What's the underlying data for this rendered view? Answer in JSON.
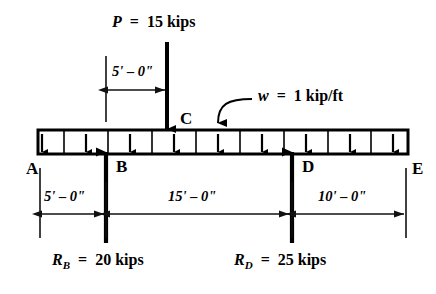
{
  "diagram": {
    "type": "beam-free-body-diagram",
    "beam": {
      "left_x": 38,
      "right_x": 408,
      "top_y": 130,
      "bottom_y": 154,
      "label": "beam"
    },
    "loads": {
      "point_load": {
        "symbol": "P",
        "equals": "=",
        "value": "15",
        "unit": "kips",
        "full_label": "P  =  15 kips",
        "applied_at_label": "C",
        "x": 167,
        "direction": "down"
      },
      "distributed_load": {
        "symbol": "w",
        "equals": "=",
        "value": "1",
        "unit": "kip/ft",
        "full_label": "w  =  1 kip/ft",
        "direction": "down",
        "arrow_count": 10,
        "arrow_x": [
          42,
          86,
          130,
          174,
          218,
          262,
          306,
          350,
          393,
          404
        ]
      }
    },
    "reactions": [
      {
        "symbol": "R",
        "subscript": "B",
        "equals": "=",
        "value": "20",
        "unit": "kips",
        "full_label": "R_B  =  20 kips",
        "at_point": "B",
        "x": 106,
        "direction": "up"
      },
      {
        "symbol": "R",
        "subscript": "D",
        "equals": "=",
        "value": "25",
        "unit": "kips",
        "full_label": "R_D  =  25 kips",
        "at_point": "D",
        "x": 292,
        "direction": "up"
      }
    ],
    "points": [
      {
        "label": "A",
        "x": 30,
        "y": 170
      },
      {
        "label": "B",
        "x": 120,
        "y": 170
      },
      {
        "label": "C",
        "x": 185,
        "y": 124
      },
      {
        "label": "D",
        "x": 306,
        "y": 170
      },
      {
        "label": "E",
        "x": 412,
        "y": 170
      }
    ],
    "dimensions": [
      {
        "name": "top-dimension-a-to-c",
        "text": "5' – 0\"",
        "from_x": 106,
        "to_x": 167,
        "y": 90,
        "label_y": 72
      },
      {
        "name": "bottom-dimension-a-to-b",
        "text": "5' – 0\"",
        "from_x": 40,
        "to_x": 106,
        "y": 214,
        "label_y": 195
      },
      {
        "name": "bottom-dimension-b-to-d",
        "text": "15' – 0\"",
        "from_x": 106,
        "to_x": 292,
        "y": 214,
        "label_y": 195
      },
      {
        "name": "bottom-dimension-d-to-e",
        "text": "10' – 0\"",
        "from_x": 292,
        "to_x": 406,
        "y": 214,
        "label_y": 195
      }
    ],
    "colors": {
      "ink": "#000000",
      "background": "#ffffff",
      "beam_fill": "#ffffff",
      "dimension_line": "#1a1a1a"
    }
  }
}
